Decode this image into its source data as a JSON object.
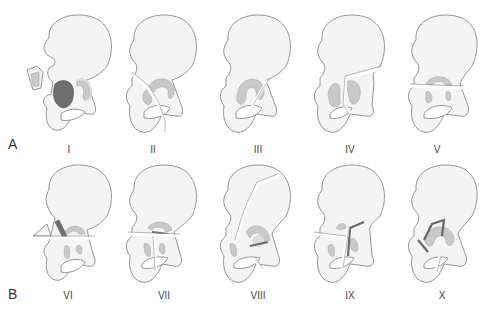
{
  "figure": {
    "rows": [
      {
        "label": "A",
        "types": [
          "I",
          "II",
          "III",
          "IV",
          "V"
        ]
      },
      {
        "label": "B",
        "types": [
          "VI",
          "VII",
          "VIII",
          "IX",
          "X"
        ]
      }
    ],
    "colors": {
      "bone": "#f4f4f4",
      "outline": "#8a8a8a",
      "acetabulum": "#c9c9c9",
      "fragment_dark": "#6e6e6e"
    }
  }
}
